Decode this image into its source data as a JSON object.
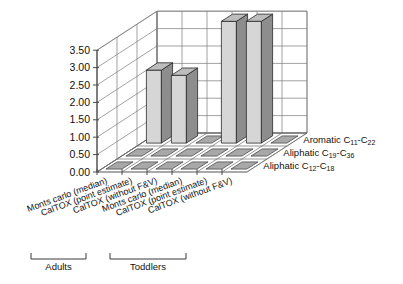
{
  "chart_data": {
    "type": "bar",
    "title": "",
    "subtitle": "",
    "xlabel": "",
    "ylabel": "",
    "zlabel": "",
    "ylim": [
      0,
      3.5
    ],
    "ytick_labels": [
      "0.00",
      "0.50",
      "1.00",
      "1.50",
      "2.00",
      "2.50",
      "3.00",
      "3.50"
    ],
    "ytick_values": [
      0,
      0.5,
      1.0,
      1.5,
      2.0,
      2.5,
      3.0,
      3.5
    ],
    "grid": true,
    "legend_position": "none",
    "projection": "3d",
    "categories": [
      "Monts carlo (median)",
      "CalTOX (point estimate)",
      "CalTOX (without F&V)",
      "Monts carlo (median)",
      "CalTOX (point estimate)",
      "CalTOX (without F&V)"
    ],
    "depth_categories": [
      "Aromatic C11-C22",
      "Aliphatic C19-C36",
      "Aliphatic C12-C18"
    ],
    "depth_labels": [
      {
        "prefix": "Aromatic C",
        "sub1": "11",
        "dash": "-C",
        "sub2": "22"
      },
      {
        "prefix": "Aliphatic C",
        "sub1": "19",
        "dash": "-C",
        "sub2": "36"
      },
      {
        "prefix": "Aliphatic C",
        "sub1": "12",
        "dash": "-C",
        "sub2": "18"
      }
    ],
    "series": [
      {
        "name": "Aromatic C11-C22",
        "values": [
          2.1,
          1.95,
          0.0,
          3.5,
          3.5,
          0.0
        ]
      },
      {
        "name": "Aliphatic C19-C36",
        "values": [
          0.0,
          0.0,
          0.0,
          0.0,
          0.0,
          0.0
        ]
      },
      {
        "name": "Aliphatic C12-C18",
        "values": [
          0.0,
          0.0,
          0.0,
          0.0,
          0.0,
          0.0
        ]
      }
    ],
    "groups": [
      {
        "label": "Adults",
        "categories": [
          0,
          1,
          2
        ]
      },
      {
        "label": "Toddlers",
        "categories": [
          3,
          4,
          5
        ]
      }
    ],
    "colors": {
      "bar_front": "#d6d6d6",
      "bar_side": "#8d8d8d",
      "bar_top": "#bdbdbd",
      "tile": "#a8a8a8",
      "axis": "#4a4a4a",
      "grid": "#7a7a7a",
      "text": "#111111",
      "background": "#ffffff"
    }
  },
  "group_labels": {
    "adults": "Adults",
    "toddlers": "Toddlers"
  }
}
